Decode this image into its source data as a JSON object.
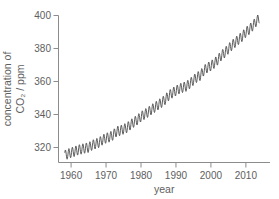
{
  "figure": {
    "background_color": "#ffffff",
    "line_color": "#4a4a4a",
    "axis_color": "#8c8c8c",
    "text_color": "#5e5e5e"
  },
  "chart_data": {
    "type": "line",
    "title": "",
    "xlabel": "year",
    "ylabel_line1": "concentration of",
    "ylabel_line2": "CO₂ / ppm",
    "x_ticks": [
      1960,
      1970,
      1980,
      1990,
      2000,
      2010
    ],
    "y_ticks": [
      320,
      340,
      360,
      380,
      400
    ],
    "xlim": [
      1956.4,
      2016.9
    ],
    "ylim": [
      310.9,
      400
    ],
    "grid": false,
    "legend": "none",
    "seasonal_amplitude_ppm": 3,
    "data_start_year": 1958.2,
    "data_end_year": 2013.9,
    "series": [
      {
        "name": "Mauna Loa atmospheric CO2 annual mean",
        "x": [
          1958,
          1959,
          1960,
          1961,
          1962,
          1963,
          1964,
          1965,
          1966,
          1967,
          1968,
          1969,
          1970,
          1971,
          1972,
          1973,
          1974,
          1975,
          1976,
          1977,
          1978,
          1979,
          1980,
          1981,
          1982,
          1983,
          1984,
          1985,
          1986,
          1987,
          1988,
          1989,
          1990,
          1991,
          1992,
          1993,
          1994,
          1995,
          1996,
          1997,
          1998,
          1999,
          2000,
          2001,
          2002,
          2003,
          2004,
          2005,
          2006,
          2007,
          2008,
          2009,
          2010,
          2011,
          2012,
          2013,
          2014
        ],
        "y": [
          315.2,
          316.0,
          316.9,
          317.6,
          318.5,
          319.0,
          319.6,
          320.0,
          321.4,
          322.2,
          323.0,
          324.6,
          325.7,
          326.3,
          327.5,
          329.7,
          330.2,
          331.1,
          332.0,
          333.8,
          335.4,
          336.8,
          338.7,
          340.1,
          341.4,
          343.0,
          344.4,
          346.0,
          347.4,
          349.2,
          351.6,
          353.1,
          354.4,
          355.6,
          356.4,
          357.1,
          358.8,
          360.8,
          362.6,
          363.7,
          366.7,
          368.4,
          369.5,
          371.1,
          373.2,
          375.8,
          377.5,
          379.8,
          381.9,
          383.8,
          385.6,
          387.4,
          389.9,
          391.6,
          393.8,
          396.5,
          398.6
        ]
      }
    ]
  }
}
